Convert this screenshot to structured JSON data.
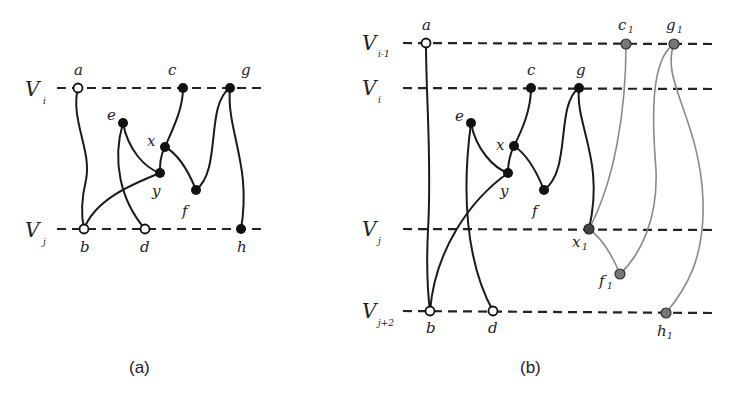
{
  "panel_a": {
    "caption": "(a)",
    "levels": [
      {
        "name": "V",
        "sub": "i",
        "y": 88
      },
      {
        "name": "V",
        "sub": "j",
        "y": 229
      }
    ],
    "nodes": {
      "a": {
        "label": "a",
        "fill": "open"
      },
      "b": {
        "label": "b",
        "fill": "open"
      },
      "c": {
        "label": "c",
        "fill": "black"
      },
      "d": {
        "label": "d",
        "fill": "open"
      },
      "e": {
        "label": "e",
        "fill": "black"
      },
      "f": {
        "label": "f",
        "fill": "black"
      },
      "g": {
        "label": "g",
        "fill": "black"
      },
      "h": {
        "label": "h",
        "fill": "black"
      },
      "x": {
        "label": "x",
        "fill": "black"
      },
      "y": {
        "label": "y",
        "fill": "black"
      }
    },
    "edges": [
      [
        "a",
        "b"
      ],
      [
        "c",
        "x"
      ],
      [
        "x",
        "y"
      ],
      [
        "x",
        "f"
      ],
      [
        "e",
        "y"
      ],
      [
        "e",
        "d"
      ],
      [
        "y",
        "b"
      ],
      [
        "g",
        "f"
      ],
      [
        "g",
        "h"
      ]
    ]
  },
  "panel_b": {
    "caption": "(b)",
    "levels": [
      {
        "name": "V",
        "sub": "i-1",
        "y": 43
      },
      {
        "name": "V",
        "sub": "i",
        "y": 88
      },
      {
        "name": "V",
        "sub": "j",
        "y": 230
      },
      {
        "name": "V",
        "sub": "j+2",
        "y": 312
      }
    ],
    "nodes": {
      "a": {
        "label": "a",
        "fill": "open"
      },
      "b": {
        "label": "b",
        "fill": "open"
      },
      "c": {
        "label": "c",
        "fill": "black"
      },
      "d": {
        "label": "d",
        "fill": "open"
      },
      "e": {
        "label": "e",
        "fill": "black"
      },
      "f": {
        "label": "f",
        "fill": "black"
      },
      "g": {
        "label": "g",
        "fill": "black"
      },
      "x": {
        "label": "x",
        "fill": "black"
      },
      "y": {
        "label": "y",
        "fill": "black"
      },
      "c1": {
        "label": "c",
        "sub": "1",
        "fill": "gray"
      },
      "g1": {
        "label": "g",
        "sub": "1",
        "fill": "gray"
      },
      "x1": {
        "label": "x",
        "sub": "1",
        "fill": "darkgray"
      },
      "f1": {
        "label": "f",
        "sub": "1",
        "fill": "gray"
      },
      "h1": {
        "label": "h",
        "sub": "1",
        "fill": "gray"
      }
    },
    "edges_black": [
      [
        "a",
        "b"
      ],
      [
        "c",
        "x"
      ],
      [
        "x",
        "y"
      ],
      [
        "x",
        "f"
      ],
      [
        "e",
        "y"
      ],
      [
        "e",
        "d"
      ],
      [
        "y",
        "b"
      ],
      [
        "g",
        "f"
      ],
      [
        "g",
        "x1"
      ]
    ],
    "edges_gray": [
      [
        "c1",
        "x1"
      ],
      [
        "x1",
        "f1"
      ],
      [
        "g1",
        "f1"
      ],
      [
        "g1",
        "h1"
      ]
    ]
  },
  "colors": {
    "node_black": "#111111",
    "node_gray": "#777777",
    "node_darkgray": "#444444",
    "edge_gray": "#8a8a8a",
    "line": "#222222"
  }
}
